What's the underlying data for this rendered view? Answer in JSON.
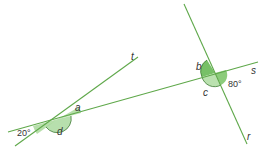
{
  "diagram": {
    "title": "",
    "colors": {
      "line": "#5fa84a",
      "angle_fill": "#6fbf5a",
      "angle_fill_light": "#bfe2b2",
      "angle_arc": "#3e7a33",
      "label": "#333333"
    },
    "lines": [
      {
        "name": "t",
        "label": "t"
      },
      {
        "name": "s",
        "label": "s"
      },
      {
        "name": "r",
        "label": "r"
      }
    ],
    "angles": {
      "a": "a",
      "b": "b",
      "c": "c",
      "d": "d",
      "given_left": "20°",
      "given_right": "80°"
    }
  }
}
